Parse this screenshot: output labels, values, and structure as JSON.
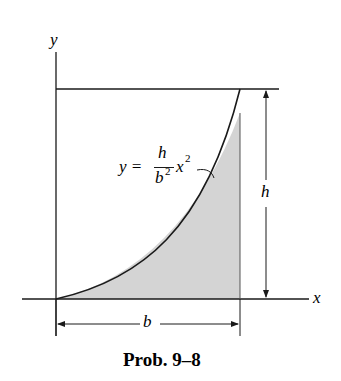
{
  "figure": {
    "caption": "Prob. 9–8",
    "axes": {
      "x_label": "x",
      "y_label": "y"
    },
    "equation": {
      "lhs": "y =",
      "numerator": "h",
      "denominator": "b",
      "denominator_exp": "2",
      "var": "x",
      "var_exp": "2"
    },
    "dimensions": {
      "width_label": "b",
      "height_label": "h"
    },
    "colors": {
      "line": "#1a1a1a",
      "shade": "#d4d4d4"
    }
  }
}
